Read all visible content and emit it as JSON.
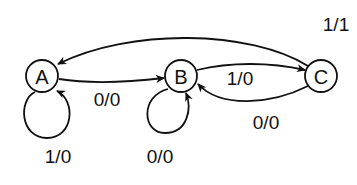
{
  "diagram": {
    "type": "state-machine",
    "nodes": [
      {
        "id": "A",
        "label": "A"
      },
      {
        "id": "B",
        "label": "B"
      },
      {
        "id": "C",
        "label": "C"
      }
    ],
    "edges": [
      {
        "from": "C",
        "to": "A",
        "label": "1/1"
      },
      {
        "from": "A",
        "to": "B",
        "label": "0/0"
      },
      {
        "from": "B",
        "to": "C",
        "label": "1/0"
      },
      {
        "from": "C",
        "to": "B",
        "label": "0/0"
      },
      {
        "from": "A",
        "to": "A",
        "label": "1/0"
      },
      {
        "from": "B",
        "to": "B",
        "label": "0/0"
      }
    ],
    "colors": {
      "stroke": "#111111",
      "background": "#ffffff"
    }
  }
}
